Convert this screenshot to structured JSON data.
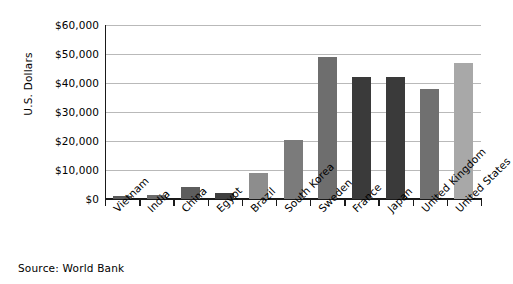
{
  "chart_data": {
    "type": "bar",
    "title": "",
    "xlabel": "",
    "ylabel": "U.S. Dollars",
    "ylim": [
      0,
      60000
    ],
    "ytick_labels": [
      "$0",
      "$10,000",
      "$20,000",
      "$30,000",
      "$40,000",
      "$50,000",
      "$60,000"
    ],
    "ytick_values": [
      0,
      10000,
      20000,
      30000,
      40000,
      50000,
      60000
    ],
    "grid": true,
    "legend": "none",
    "categories": [
      "Vietnam",
      "India",
      "China",
      "Egypt",
      "Brazil",
      "South Korea",
      "Sweden",
      "France",
      "Japan",
      "United Kingdom",
      "United States"
    ],
    "values": [
      1000,
      1300,
      4000,
      2200,
      9000,
      20500,
      49000,
      42000,
      42000,
      38000,
      47000
    ],
    "bar_colors": [
      "#5a5a5a",
      "#6b6b6b",
      "#5d5d5d",
      "#3f3f3f",
      "#8d8d8d",
      "#7b7b7b",
      "#6e6e6e",
      "#3a3a3a",
      "#3a3a3a",
      "#707070",
      "#a8a8a8"
    ],
    "annotations": [
      "Source:  World Bank"
    ]
  },
  "source": {
    "text": "Source:  World Bank"
  },
  "colors": {
    "axis": "#1a1a1a",
    "gridline": "#b9b9b9",
    "background": "#ffffff",
    "text": "#000000"
  }
}
